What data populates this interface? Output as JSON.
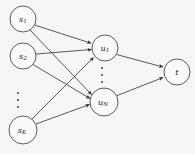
{
  "figure": {
    "title": "",
    "background_color": "#f7f6f4",
    "node_fill": "#fbfaf8",
    "node_stroke": "#4a4a4a",
    "edge_color": "#3b3b3b",
    "width": 195,
    "height": 154
  },
  "chart_data": {
    "type": "diagram",
    "diagram_kind": "directed-graph",
    "title": "",
    "layers": [
      {
        "name": "source-layer",
        "nodes": [
          {
            "id": "s1",
            "label": "s",
            "subscript": "1",
            "cx": 23,
            "cy": 19,
            "r": 13
          },
          {
            "id": "s2",
            "label": "s",
            "subscript": "2",
            "cx": 23,
            "cy": 56,
            "r": 13
          },
          {
            "id": "sK",
            "label": "s",
            "subscript": "K",
            "cx": 23,
            "cy": 130,
            "r": 14
          }
        ],
        "ellipsis": {
          "x": 18,
          "y0": 93,
          "y1": 107,
          "dots": 3,
          "orientation": "vertical"
        }
      },
      {
        "name": "hidden-layer",
        "nodes": [
          {
            "id": "u1",
            "label": "u",
            "subscript": "1",
            "cx": 105,
            "cy": 48,
            "r": 13
          },
          {
            "id": "uN",
            "label": "u",
            "subscript": "N",
            "cx": 104,
            "cy": 102,
            "r": 14
          }
        ],
        "ellipsis": {
          "x": 102,
          "y0": 68,
          "y1": 82,
          "dots": 3,
          "orientation": "vertical"
        }
      },
      {
        "name": "target-layer",
        "nodes": [
          {
            "id": "t",
            "label": "t",
            "subscript": "",
            "cx": 177,
            "cy": 72,
            "r": 13
          }
        ]
      }
    ],
    "edges": [
      {
        "from": "s1",
        "to": "u1",
        "directed": true
      },
      {
        "from": "s1",
        "to": "uN",
        "directed": true
      },
      {
        "from": "s2",
        "to": "u1",
        "directed": true
      },
      {
        "from": "s2",
        "to": "uN",
        "directed": true
      },
      {
        "from": "sK",
        "to": "u1",
        "directed": true
      },
      {
        "from": "sK",
        "to": "uN",
        "directed": true
      },
      {
        "from": "u1",
        "to": "t",
        "directed": true
      },
      {
        "from": "uN",
        "to": "t",
        "directed": true
      }
    ],
    "labels": {
      "s1": "s₁",
      "s2": "s₂",
      "sK": "s_K",
      "u1": "u₁",
      "uN": "u_N",
      "t": "t"
    }
  }
}
